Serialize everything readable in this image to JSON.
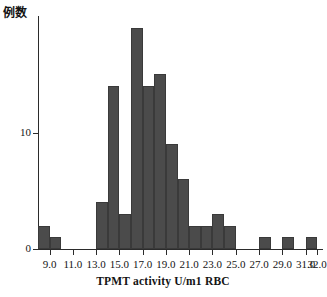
{
  "chart_data": {
    "type": "bar",
    "title": "",
    "xlabel": "TPMT activity U/m1 RBC",
    "ylabel": "例数",
    "xlim": [
      8.0,
      32.5
    ],
    "ylim": [
      0,
      20
    ],
    "grid": false,
    "legend": "none",
    "bar_color": "#4b4b4b",
    "axis_color": "#2b2b2b",
    "bin_width": 1.0,
    "xticks": [
      "9.0",
      "11.0",
      "13.0",
      "15.0",
      "17.0",
      "19.0",
      "21.0",
      "23.0",
      "25.0",
      "27.0",
      "29.0",
      "31.0",
      "32.0"
    ],
    "xtick_values": [
      9.0,
      11.0,
      13.0,
      15.0,
      17.0,
      19.0,
      21.0,
      23.0,
      25.0,
      27.0,
      29.0,
      31.0,
      32.0
    ],
    "yticks": [
      "0",
      "10"
    ],
    "ytick_values": [
      0,
      10
    ],
    "categories": [
      "8.5",
      "9.5",
      "10.5",
      "11.5",
      "12.5",
      "13.5",
      "14.5",
      "15.5",
      "16.5",
      "17.5",
      "18.5",
      "19.5",
      "20.5",
      "21.5",
      "22.5",
      "23.5",
      "24.5",
      "25.5",
      "26.5",
      "27.5",
      "28.5",
      "29.5",
      "30.5",
      "31.5"
    ],
    "bin_centers": [
      8.5,
      9.5,
      10.5,
      11.5,
      12.5,
      13.5,
      14.5,
      15.5,
      16.5,
      17.5,
      18.5,
      19.5,
      20.5,
      21.5,
      22.5,
      23.5,
      24.5,
      25.5,
      26.5,
      27.5,
      28.5,
      29.5,
      30.5,
      31.5
    ],
    "values": [
      2,
      1,
      0,
      0,
      0,
      4,
      14,
      3,
      19,
      14,
      15,
      9,
      6,
      2,
      2,
      3,
      2,
      0,
      0,
      1,
      0,
      1,
      0,
      1
    ]
  }
}
